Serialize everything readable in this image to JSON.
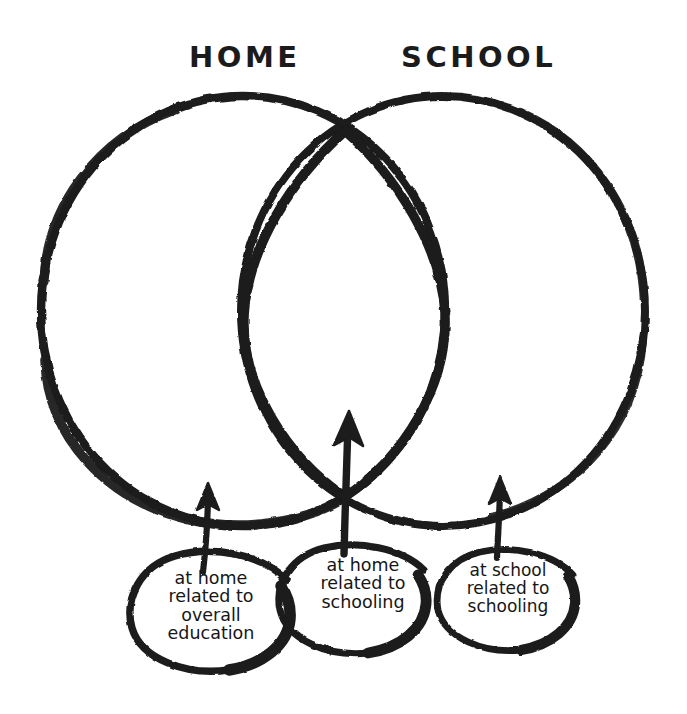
{
  "diagram": {
    "type": "venn",
    "style": "hand-drawn marker sketch",
    "background_color": "#ffffff",
    "ink_color": "#1b1b1b",
    "sets": [
      {
        "id": "home",
        "label": "HOME"
      },
      {
        "id": "school",
        "label": "SCHOOL"
      }
    ],
    "regions": [
      {
        "id": "home-only",
        "belongs_to": "HOME",
        "callout_label": "at home\nrelated to\noverall\neducation"
      },
      {
        "id": "intersection",
        "belongs_to": "HOME ∩ SCHOOL",
        "callout_label": "at home\nrelated to\nschooling"
      },
      {
        "id": "school-only",
        "belongs_to": "SCHOOL",
        "callout_label": "at school\nrelated to\nschooling"
      }
    ],
    "callouts": [
      {
        "id": "callout-1",
        "text": "at home\nrelated to\noverall\neducation",
        "arrow": "up"
      },
      {
        "id": "callout-2",
        "text": "at home\nrelated to\nschooling",
        "arrow": "up"
      },
      {
        "id": "callout-3",
        "text": "at school\nrelated to\nschooling",
        "arrow": "up"
      }
    ]
  },
  "labels": {
    "home": "HOME",
    "school": "SCHOOL"
  },
  "bubbles": {
    "left": {
      "text": "at home\nrelated to\noverall\neducation"
    },
    "middle": {
      "text": "at home\nrelated to\nschooling"
    },
    "right": {
      "text": "at school\nrelated to\nschooling"
    }
  },
  "colors": {
    "ink": "#1b1b1b",
    "paper": "#ffffff"
  }
}
